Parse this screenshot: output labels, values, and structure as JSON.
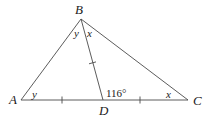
{
  "diagram": {
    "type": "triangle",
    "points": {
      "A": {
        "label": "A",
        "x": 21,
        "y": 100
      },
      "B": {
        "label": "B",
        "x": 81,
        "y": 19
      },
      "C": {
        "label": "C",
        "x": 188,
        "y": 100
      },
      "D": {
        "label": "D",
        "x": 103,
        "y": 100
      }
    },
    "segments": [
      {
        "name": "AB",
        "from": "A",
        "to": "B"
      },
      {
        "name": "BC",
        "from": "B",
        "to": "C"
      },
      {
        "name": "AC",
        "from": "A",
        "to": "C"
      },
      {
        "name": "BD",
        "from": "B",
        "to": "D"
      }
    ],
    "congruence_ticks": [
      "AD",
      "DC",
      "BD"
    ],
    "angles": {
      "angle_A": "y",
      "angle_ABD": "y",
      "angle_DBC": "x",
      "angle_C": "x",
      "angle_BDC": "116°"
    }
  }
}
